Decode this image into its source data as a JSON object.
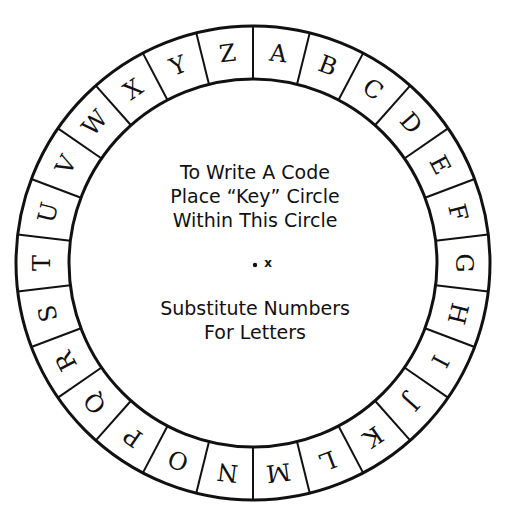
{
  "wheel": {
    "letters": [
      "A",
      "B",
      "C",
      "D",
      "E",
      "F",
      "G",
      "H",
      "I",
      "J",
      "K",
      "L",
      "M",
      "N",
      "O",
      "P",
      "Q",
      "R",
      "S",
      "T",
      "U",
      "V",
      "W",
      "X",
      "Y",
      "Z"
    ],
    "stroke_color": "#111111"
  },
  "center_text": {
    "line1": "To Write A Code",
    "line2": "Place “Key” Circle",
    "line3": "Within This Circle",
    "marker": "x",
    "line4": "Substitute Numbers",
    "line5": "For Letters"
  }
}
